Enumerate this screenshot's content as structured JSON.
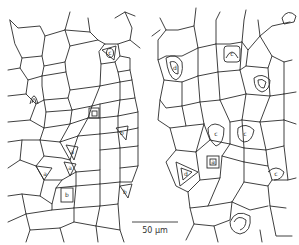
{
  "figure": {
    "type": "epidermal cell line drawing",
    "panels": [
      "left",
      "right"
    ],
    "scale_bar": {
      "label": "50 µm"
    },
    "stomata": [
      {
        "panel": "left",
        "x": 110,
        "y": 52,
        "label": "c"
      },
      {
        "panel": "left",
        "x": 34,
        "y": 97,
        "label": ""
      },
      {
        "panel": "left",
        "x": 95,
        "y": 112,
        "label": ""
      },
      {
        "panel": "left",
        "x": 72,
        "y": 152,
        "label": "a"
      },
      {
        "panel": "left",
        "x": 70,
        "y": 167,
        "label": "a"
      },
      {
        "panel": "left",
        "x": 46,
        "y": 174,
        "label": "a"
      },
      {
        "panel": "left",
        "x": 67,
        "y": 195,
        "label": "b"
      },
      {
        "panel": "left",
        "x": 122,
        "y": 133,
        "label": "b"
      },
      {
        "panel": "left",
        "x": 125,
        "y": 192,
        "label": "b"
      },
      {
        "panel": "right",
        "x": 175,
        "y": 68,
        "label": "d"
      },
      {
        "panel": "right",
        "x": 232,
        "y": 54,
        "label": "c"
      },
      {
        "panel": "right",
        "x": 262,
        "y": 83,
        "label": ""
      },
      {
        "panel": "right",
        "x": 218,
        "y": 136,
        "label": "c"
      },
      {
        "panel": "right",
        "x": 245,
        "y": 135,
        "label": "c"
      },
      {
        "panel": "right",
        "x": 213,
        "y": 162,
        "label": "a"
      },
      {
        "panel": "right",
        "x": 186,
        "y": 173,
        "label": "d"
      },
      {
        "panel": "right",
        "x": 277,
        "y": 172,
        "label": "c"
      },
      {
        "panel": "right",
        "x": 240,
        "y": 225,
        "label": ""
      },
      {
        "panel": "right",
        "x": 290,
        "y": 18,
        "label": ""
      }
    ]
  }
}
